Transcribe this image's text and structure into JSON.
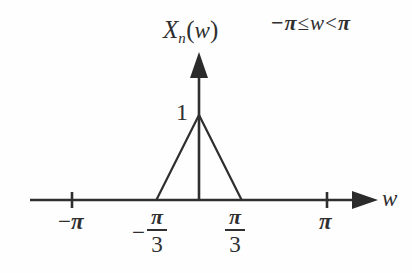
{
  "figure": {
    "background_color": "#fefefe",
    "ink_color": "#2f2f2f",
    "y_axis_label": {
      "base": "X",
      "subscript": "n",
      "open_paren": "(",
      "argument": "w",
      "close_paren": ")",
      "full": "X_n(w)"
    },
    "range_note": {
      "minus": "−",
      "pi_left": "π",
      "leq": "≤",
      "variable": "w",
      "lt": "<",
      "pi_right": "π",
      "full": "−π ≤ w < π"
    },
    "peak_label": "1",
    "x_axis_label": "w"
  },
  "ticks": {
    "neg_pi": {
      "sign": "−",
      "symbol": "π",
      "full": "−π",
      "value": -3.14159
    },
    "neg_pi_over_3": {
      "sign": "−",
      "numerator": "π",
      "denominator": "3",
      "full": "−π/3",
      "value": -1.0472
    },
    "pos_pi_over_3": {
      "numerator": "π",
      "denominator": "3",
      "full": "π/3",
      "value": 1.0472
    },
    "pos_pi": {
      "symbol": "π",
      "full": "π",
      "value": 3.14159
    }
  },
  "chart_data": {
    "type": "line",
    "subtitle": "−π ≤ w < π",
    "xlabel": "w",
    "ylabel": "X_n(w)",
    "xlim": [
      -3.14159,
      3.14159
    ],
    "ylim": [
      0,
      1
    ],
    "grid": false,
    "legend": null,
    "xtick_values": [
      -3.14159,
      -1.0472,
      1.0472,
      3.14159
    ],
    "xtick_labels": [
      "−π",
      "−π/3",
      "π/3",
      "π"
    ],
    "ytick_values": [
      1
    ],
    "ytick_labels": [
      "1"
    ],
    "series": [
      {
        "name": "X_n(w)",
        "description": "Triangular pulse of unit height, zero outside |w| > π/3",
        "x": [
          -3.14159,
          -1.0472,
          0,
          1.0472,
          3.14159
        ],
        "y": [
          0,
          0,
          1,
          0,
          0
        ]
      }
    ],
    "annotations": [
      {
        "text": "1",
        "x": 0,
        "y": 1,
        "note": "peak amplitude at w = 0"
      },
      {
        "text": "−π ≤ w < π",
        "note": "domain restriction shown top-right"
      }
    ]
  }
}
